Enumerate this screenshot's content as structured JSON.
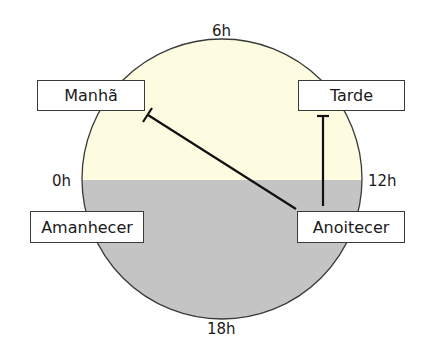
{
  "diagram": {
    "hours": {
      "top": "6h",
      "bottom": "18h",
      "left": "0h",
      "right": "12h"
    },
    "labels": {
      "manha": "Manhã",
      "tarde": "Tarde",
      "amanhecer": "Amanhecer",
      "anoitecer": "Anoitecer"
    },
    "colors": {
      "day_half": "#fdfbe0",
      "night_half": "#c4c4c4",
      "outline": "#3a3a3a",
      "connector": "#111111"
    }
  }
}
